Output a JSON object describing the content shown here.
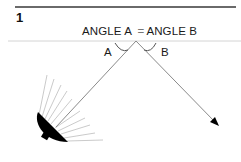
{
  "figure": {
    "number": "1",
    "equation": {
      "left": "ANGLE A",
      "operator": "=",
      "right": "ANGLE B"
    },
    "angle_labels": {
      "a": "A",
      "b": "B"
    },
    "colors": {
      "rule_top": "#6a6a6a",
      "surface_line": "#d0d0d0",
      "ray": "#8a8a8a",
      "lamp": "#000000",
      "light_rays": "#bdbdbd",
      "text": "#1a1a1a"
    }
  }
}
